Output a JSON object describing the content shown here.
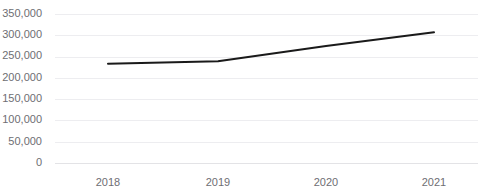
{
  "chart_data": {
    "type": "line",
    "title": "",
    "subtitle": "",
    "xlabel": "",
    "ylabel": "",
    "categories": [
      "2018",
      "2019",
      "2020",
      "2021"
    ],
    "x": [
      2018,
      2019,
      2020,
      2021
    ],
    "series": [
      {
        "name": "",
        "values": [
          233000,
          239000,
          275000,
          307000
        ]
      }
    ],
    "values": [
      233000,
      239000,
      275000,
      307000
    ],
    "ylim": [
      0,
      350000
    ],
    "ytick_values": [
      0,
      50000,
      100000,
      150000,
      200000,
      250000,
      300000,
      350000
    ],
    "ytick_labels": [
      "0",
      "50,000",
      "100,000",
      "150,000",
      "200,000",
      "250,000",
      "300,000",
      "350,000"
    ],
    "xtick_labels": [
      "2018",
      "2019",
      "2020",
      "2021"
    ],
    "grid": true,
    "grid_axis": "y",
    "legend": false,
    "legend_position": "none",
    "annotations": [],
    "colors": {
      "line": "#1a1a1a",
      "gridline": "#ededf0",
      "axis": "#e3e3e6",
      "tick_label": "#6e6e73",
      "background": "#ffffff"
    }
  },
  "plot_geometry": {
    "left": 55,
    "right": 478,
    "top": 14,
    "bottom": 163,
    "x_positions": [
      108,
      218,
      326,
      434
    ]
  }
}
